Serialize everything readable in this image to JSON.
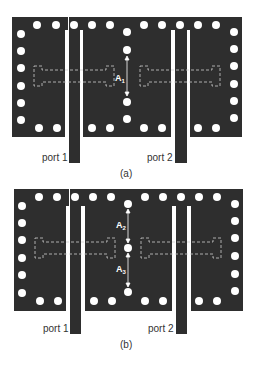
{
  "colors": {
    "board": "#2e2e2e",
    "via": "#ffffff",
    "slot": "#ffffff",
    "dashed": "#cfcfcf",
    "text": "#333333"
  },
  "figures": [
    {
      "id": "a",
      "caption": "(a)",
      "port_labels": [
        "port 1",
        "port 2"
      ],
      "dimension_labels": [
        {
          "base": "A",
          "sub": "1"
        }
      ]
    },
    {
      "id": "b",
      "caption": "(b)",
      "port_labels": [
        "port 1",
        "port 2"
      ],
      "dimension_labels": [
        {
          "base": "A",
          "sub": "2"
        },
        {
          "base": "A",
          "sub": "3"
        }
      ]
    }
  ]
}
